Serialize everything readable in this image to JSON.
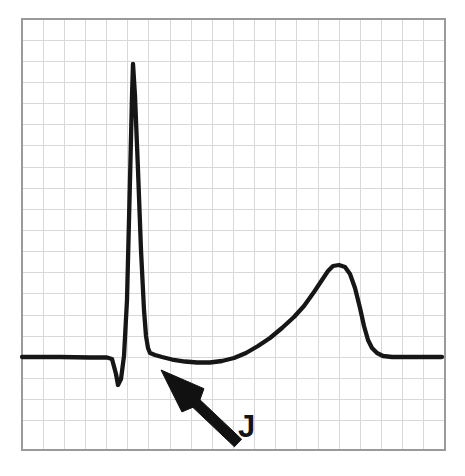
{
  "figure": {
    "name": "ecg-j-point-diagram",
    "width": 465,
    "height": 476,
    "background_color": "#ffffff"
  },
  "grid": {
    "name": "ecg-graph-paper",
    "x": 22,
    "y": 19,
    "width": 423,
    "height": 431,
    "cell_size": 21.15,
    "minor_color": "#d8d8d8",
    "border_color": "#9a9a9a",
    "columns": 20,
    "rows": 20,
    "visible": true
  },
  "trace": {
    "name": "ecg-waveform",
    "color": "#161616",
    "stroke_width": 4.3,
    "baseline_y": 357,
    "path": "M 22,357 L 60,357 L 90,357.5 L 107,357.5 L 112,359 L 116,374 L 118,385 L 121,379 L 124,356 L 127,300 L 130,180 L 132,96 L 133,64 L 135,96 L 138,170 L 141,250 L 144,310 L 146,336 L 148,348 L 150,353 L 155,355 L 162,357 L 172,359.5 L 185,361.5 L 197,362.5 L 210,362.5 L 222,361 L 234,358 L 246,353 L 258,346 L 270,338 L 282,328 L 294,317 L 304,306 L 314,292 L 322,280 L 328,271 L 333,266 L 339,265 L 345,267 L 350,274 L 355,288 L 360,308 L 364,326 L 368,340 L 372,348 L 377,353 L 383,356 L 392,357 L 410,357 L 442,357",
    "features": [
      {
        "name": "isoelectric-baseline-left",
        "label": "baseline",
        "x_start": 22,
        "x_end": 107,
        "y": 357
      },
      {
        "name": "q-wave",
        "label": "Q",
        "x": 118,
        "y": 385
      },
      {
        "name": "r-wave-peak",
        "label": "R",
        "x": 133,
        "y": 64
      },
      {
        "name": "s-limb-descent",
        "label": "S descent",
        "x": 148,
        "y": 348
      },
      {
        "name": "j-point",
        "label": "J",
        "x": 150,
        "y": 353
      },
      {
        "name": "st-segment-trough",
        "label": "ST segment",
        "x": 203,
        "y": 362.5
      },
      {
        "name": "t-wave-peak",
        "label": "T",
        "x": 336,
        "y": 265
      },
      {
        "name": "isoelectric-baseline-right",
        "label": "baseline",
        "x_start": 392,
        "x_end": 442,
        "y": 357
      }
    ]
  },
  "annotation": {
    "name": "j-point-annotation",
    "label": "J",
    "label_x": 238,
    "label_y": 437,
    "label_font_size": 31,
    "label_color": "#141414",
    "arrow": {
      "name": "j-point-arrow",
      "color": "#111111",
      "tip_x": 161,
      "tip_y": 370,
      "tail_x": 238,
      "tail_y": 443,
      "points_to": "j-point"
    }
  }
}
